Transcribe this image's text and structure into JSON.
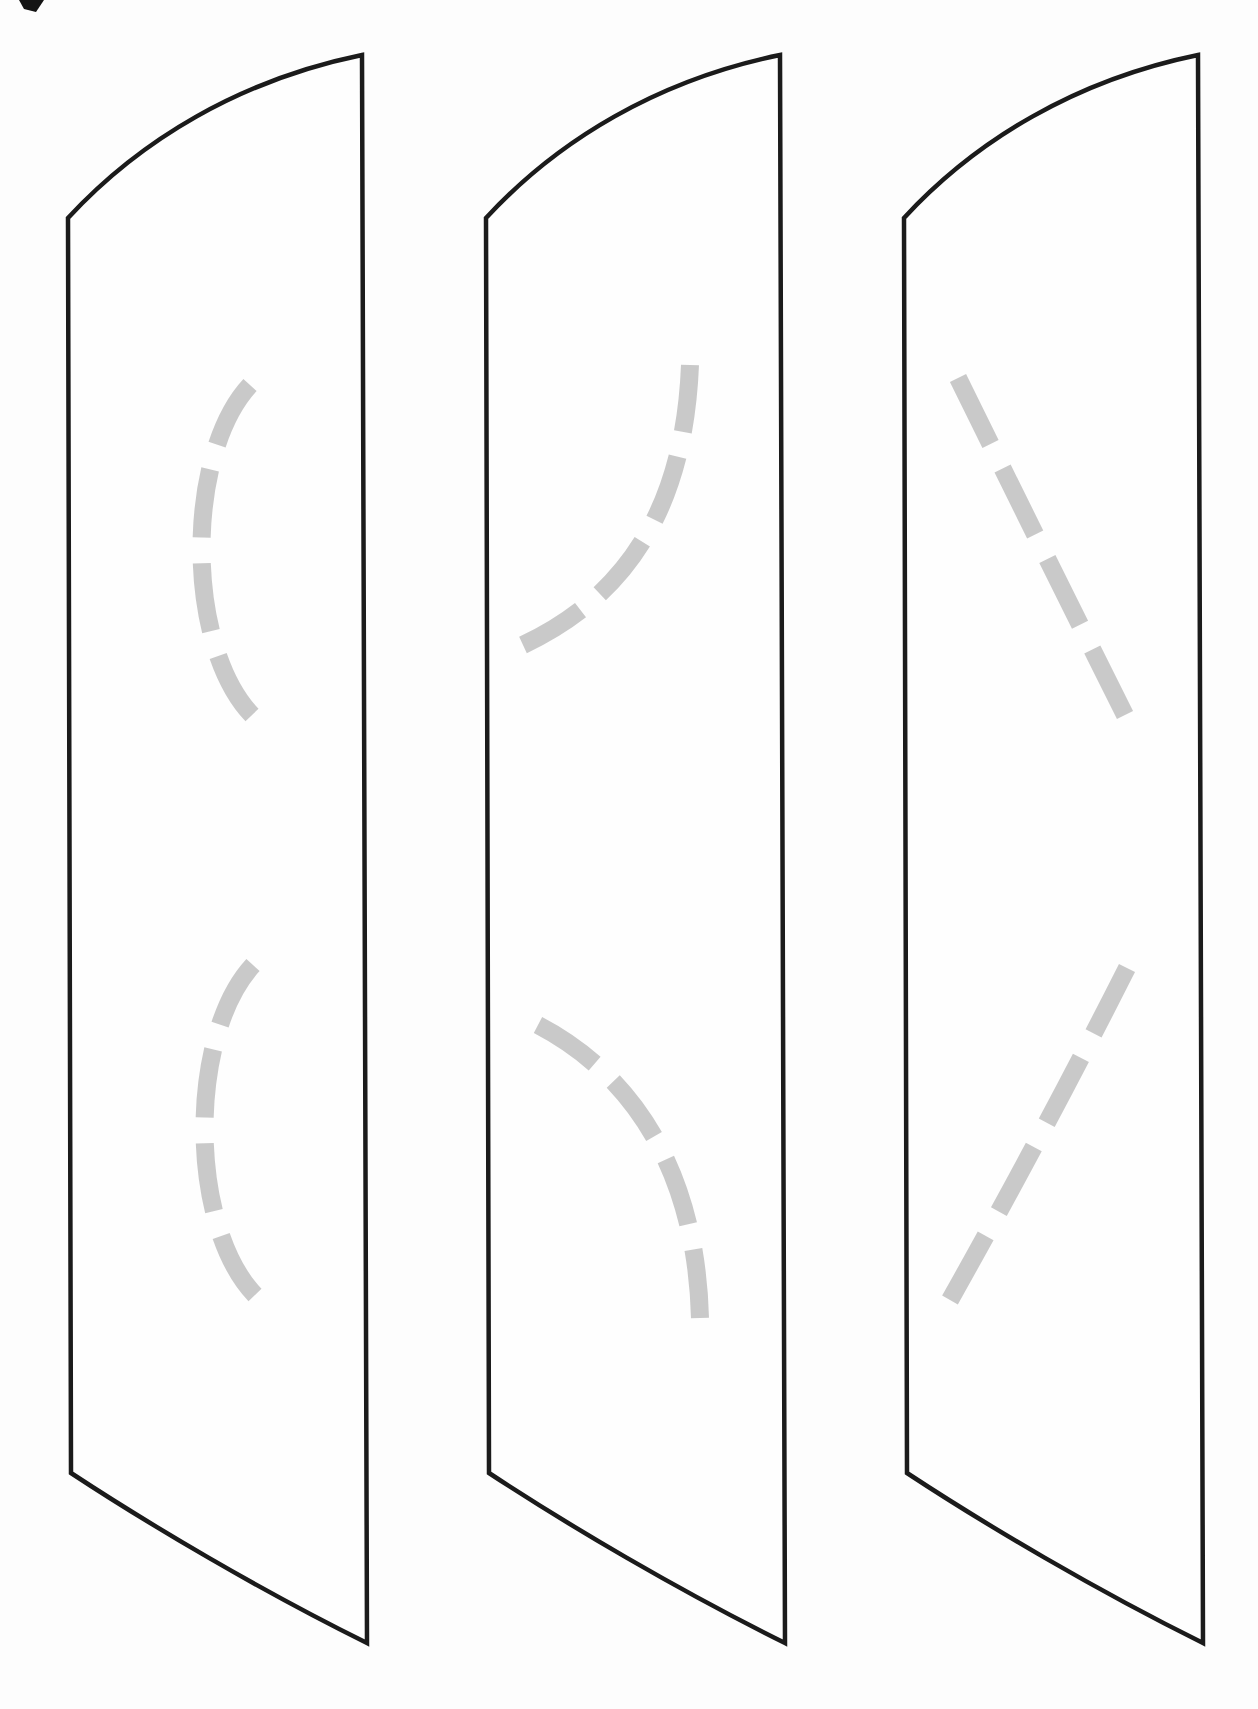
{
  "page": {
    "background_color": "#fdfdfd"
  },
  "style": {
    "outline_color": "#1b1b1b",
    "outline_width": 4.5,
    "guide_dash_color": "#c6c6c6",
    "guide_dash_width": 18,
    "guide_dash_pattern": "80 30",
    "corner_mark_color": "#141414"
  },
  "corner_mark": {
    "path": "M 19 0 L 44 0 L 36 12 L 24 9 Z"
  },
  "panels": [
    {
      "name": "slat-1",
      "outline": "M 68 218 C 140 140 240 80 362 55 L 367 1643 C 260 1590 150 1525 71 1473 Z",
      "guides": [
        "M 250 385 C 185 455 185 645 252 715",
        "M 253 965 C 188 1035 188 1225 255 1295"
      ]
    },
    {
      "name": "slat-2",
      "outline": "M 486 218 C 558 140 658 80 780 55 L 785 1643 C 678 1590 568 1525 489 1473 Z",
      "guides": [
        "M 690 365 C 685 490 640 590 523 645",
        "M 538 1025 C 628 1072 696 1165 700 1318"
      ]
    },
    {
      "name": "slat-3",
      "outline": "M 904 218 C 976 140 1076 80 1198 55 L 1203 1643 C 1096 1590 986 1525 907 1473 Z",
      "guides": [
        "M 958 378 Q 1045 555 1125 715",
        "M 1127 968 Q 1042 1136 950 1300"
      ]
    }
  ]
}
